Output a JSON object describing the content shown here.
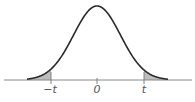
{
  "chart_data": {
    "type": "area",
    "title": "",
    "xlabel": "",
    "ylabel": "",
    "tick_labels": [
      "-t",
      "0",
      "t"
    ],
    "tick_positions": [
      -2.0,
      0,
      2.0
    ],
    "xlim": [
      -4,
      4
    ],
    "shaded_regions": [
      {
        "from": "-inf",
        "to": "-t",
        "label": "left tail"
      },
      {
        "from": "t",
        "to": "inf",
        "label": "right tail"
      }
    ],
    "grid": false,
    "legend": null,
    "colors": {
      "curve": "#2a2a2a",
      "shade": "#b8b8b8",
      "axis": "#777777"
    }
  }
}
